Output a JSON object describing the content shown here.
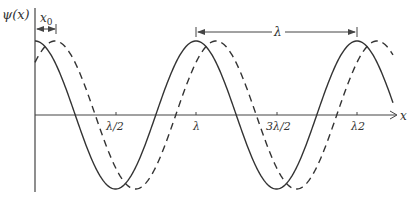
{
  "chart_data": {
    "type": "line",
    "title": "",
    "ylabel": "ψ(x)",
    "xlabel": "x",
    "tick_labels": [
      "λ/2",
      "λ",
      "3λ/2",
      "λ2"
    ],
    "annotations": {
      "shift": "x0",
      "wavelength": "λ"
    },
    "series": [
      {
        "name": "ψ(x)",
        "style": "solid",
        "function": "A cos(2πx/λ)"
      },
      {
        "name": "ψ(x - x0)",
        "style": "dashed",
        "function": "A cos(2π(x - x0)/λ)"
      }
    ],
    "grid": false
  },
  "labels": {
    "y_axis": "ψ(x)",
    "x_axis": "x",
    "x0": "x",
    "x0_sub": "0",
    "lambda": "λ",
    "t1": "λ/2",
    "t2": "λ",
    "t3": "3λ/2",
    "t4": "λ2"
  }
}
